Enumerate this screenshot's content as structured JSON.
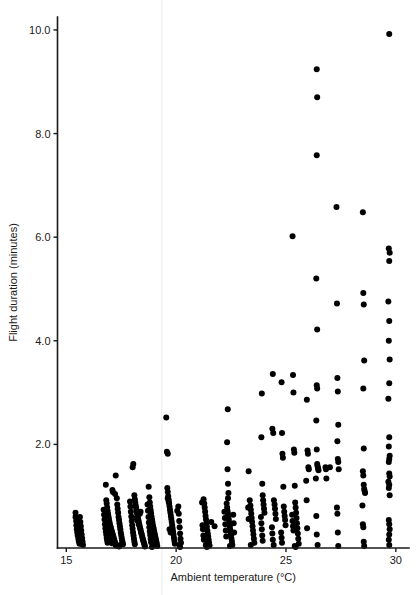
{
  "figure": {
    "background_color": "#ffffff",
    "point_color": "#000000",
    "axis_color": "#1a1a1a",
    "artifact_color": "#ececec"
  },
  "chart_data": {
    "type": "scatter",
    "title": "",
    "subtitle": "",
    "xlabel": "Ambient temperature (°C)",
    "ylabel": "Flight duration (minutes)",
    "xlim": [
      14.6,
      30.6
    ],
    "ylim": [
      0.0,
      10.25
    ],
    "xticks": [
      15,
      20,
      25,
      30
    ],
    "xticklabels": [
      "15",
      "20",
      "25",
      "30"
    ],
    "yticks": [
      2.0,
      4.0,
      6.0,
      8.0,
      10.0
    ],
    "yticklabels": [
      "2.0",
      "4.0",
      "6.0",
      "8.0",
      "10.0"
    ],
    "grid": false,
    "legend": null,
    "marker": "filled-circle",
    "marker_size_px": 3.0,
    "n_points": 403,
    "points": [
      [
        15.42,
        0.68
      ],
      [
        15.42,
        0.6
      ],
      [
        15.45,
        0.52
      ],
      [
        15.46,
        0.44
      ],
      [
        15.48,
        0.36
      ],
      [
        15.5,
        0.3
      ],
      [
        15.52,
        0.24
      ],
      [
        15.55,
        0.18
      ],
      [
        15.57,
        0.13
      ],
      [
        15.6,
        0.08
      ],
      [
        15.62,
        0.6
      ],
      [
        15.64,
        0.5
      ],
      [
        15.66,
        0.42
      ],
      [
        15.68,
        0.34
      ],
      [
        15.7,
        0.26
      ],
      [
        15.72,
        0.19
      ],
      [
        15.74,
        0.12
      ],
      [
        15.76,
        0.06
      ],
      [
        16.8,
        1.22
      ],
      [
        16.82,
        0.92
      ],
      [
        16.84,
        0.86
      ],
      [
        16.86,
        0.78
      ],
      [
        16.88,
        0.72
      ],
      [
        16.9,
        0.66
      ],
      [
        16.92,
        0.61
      ],
      [
        16.94,
        0.56
      ],
      [
        16.96,
        0.51
      ],
      [
        16.98,
        0.47
      ],
      [
        17.0,
        0.43
      ],
      [
        17.02,
        0.4
      ],
      [
        17.04,
        0.37
      ],
      [
        17.06,
        0.34
      ],
      [
        17.08,
        0.31
      ],
      [
        17.1,
        0.28
      ],
      [
        17.12,
        0.25
      ],
      [
        17.14,
        0.22
      ],
      [
        17.16,
        0.19
      ],
      [
        17.18,
        0.16
      ],
      [
        17.2,
        0.13
      ],
      [
        17.22,
        0.1
      ],
      [
        17.24,
        0.07
      ],
      [
        17.26,
        0.05
      ],
      [
        16.7,
        0.74
      ],
      [
        16.72,
        0.64
      ],
      [
        16.74,
        0.55
      ],
      [
        16.76,
        0.46
      ],
      [
        16.78,
        0.38
      ],
      [
        16.8,
        0.32
      ],
      [
        16.82,
        0.26
      ],
      [
        16.84,
        0.2
      ],
      [
        16.86,
        0.15
      ],
      [
        16.88,
        0.1
      ],
      [
        17.3,
        0.96
      ],
      [
        17.32,
        0.84
      ],
      [
        17.34,
        0.76
      ],
      [
        17.36,
        0.68
      ],
      [
        17.38,
        0.6
      ],
      [
        17.4,
        0.54
      ],
      [
        17.42,
        0.48
      ],
      [
        17.44,
        0.42
      ],
      [
        17.46,
        0.36
      ],
      [
        17.48,
        0.3
      ],
      [
        17.5,
        0.25
      ],
      [
        17.52,
        0.2
      ],
      [
        17.54,
        0.15
      ],
      [
        17.56,
        0.11
      ],
      [
        17.58,
        0.07
      ],
      [
        17.25,
        1.4
      ],
      [
        17.1,
        1.12
      ],
      [
        17.12,
        1.08
      ],
      [
        17.22,
        1.04
      ],
      [
        18.05,
        1.62
      ],
      [
        18.02,
        1.56
      ],
      [
        18.1,
        1.02
      ],
      [
        18.12,
        0.94
      ],
      [
        18.14,
        0.88
      ],
      [
        18.16,
        0.82
      ],
      [
        18.18,
        0.77
      ],
      [
        18.2,
        0.72
      ],
      [
        18.22,
        0.67
      ],
      [
        18.24,
        0.62
      ],
      [
        18.26,
        0.58
      ],
      [
        18.28,
        0.54
      ],
      [
        18.3,
        0.5
      ],
      [
        18.32,
        0.46
      ],
      [
        18.34,
        0.42
      ],
      [
        18.36,
        0.38
      ],
      [
        18.38,
        0.35
      ],
      [
        18.4,
        0.31
      ],
      [
        18.42,
        0.28
      ],
      [
        18.44,
        0.25
      ],
      [
        18.46,
        0.21
      ],
      [
        18.48,
        0.18
      ],
      [
        18.5,
        0.15
      ],
      [
        18.52,
        0.12
      ],
      [
        18.54,
        0.09
      ],
      [
        18.56,
        0.06
      ],
      [
        18.58,
        0.03
      ],
      [
        17.9,
        0.9
      ],
      [
        17.92,
        0.8
      ],
      [
        17.94,
        0.7
      ],
      [
        17.96,
        0.61
      ],
      [
        17.98,
        0.52
      ],
      [
        18.0,
        0.44
      ],
      [
        18.02,
        0.37
      ],
      [
        18.04,
        0.3
      ],
      [
        18.06,
        0.24
      ],
      [
        18.08,
        0.18
      ],
      [
        18.1,
        0.12
      ],
      [
        18.12,
        0.07
      ],
      [
        18.75,
        1.18
      ],
      [
        18.78,
        0.98
      ],
      [
        18.8,
        0.88
      ],
      [
        18.82,
        0.8
      ],
      [
        18.84,
        0.73
      ],
      [
        18.86,
        0.67
      ],
      [
        18.88,
        0.61
      ],
      [
        18.9,
        0.55
      ],
      [
        18.92,
        0.5
      ],
      [
        18.94,
        0.45
      ],
      [
        18.96,
        0.4
      ],
      [
        18.98,
        0.36
      ],
      [
        19.0,
        0.32
      ],
      [
        19.02,
        0.28
      ],
      [
        19.04,
        0.24
      ],
      [
        19.06,
        0.2
      ],
      [
        19.08,
        0.16
      ],
      [
        19.1,
        0.12
      ],
      [
        19.12,
        0.08
      ],
      [
        19.14,
        0.04
      ],
      [
        18.7,
        0.84
      ],
      [
        18.72,
        0.72
      ],
      [
        18.74,
        0.6
      ],
      [
        18.76,
        0.49
      ],
      [
        18.78,
        0.4
      ],
      [
        18.8,
        0.32
      ],
      [
        18.82,
        0.25
      ],
      [
        18.84,
        0.18
      ],
      [
        18.86,
        0.11
      ],
      [
        19.55,
        2.52
      ],
      [
        19.58,
        1.86
      ],
      [
        19.62,
        1.82
      ],
      [
        19.6,
        1.16
      ],
      [
        19.62,
        1.08
      ],
      [
        19.64,
        1.0
      ],
      [
        19.66,
        0.93
      ],
      [
        19.68,
        0.86
      ],
      [
        19.7,
        0.8
      ],
      [
        19.72,
        0.74
      ],
      [
        19.74,
        0.68
      ],
      [
        19.76,
        0.62
      ],
      [
        19.78,
        0.56
      ],
      [
        19.8,
        0.5
      ],
      [
        19.82,
        0.44
      ],
      [
        19.84,
        0.38
      ],
      [
        19.86,
        0.32
      ],
      [
        19.88,
        0.26
      ],
      [
        19.9,
        0.2
      ],
      [
        19.92,
        0.14
      ],
      [
        19.94,
        0.08
      ],
      [
        20.1,
        0.8
      ],
      [
        20.12,
        0.66
      ],
      [
        20.14,
        0.52
      ],
      [
        20.16,
        0.4
      ],
      [
        20.18,
        0.28
      ],
      [
        20.2,
        0.18
      ],
      [
        20.22,
        0.1
      ],
      [
        20.05,
        0.72
      ],
      [
        21.25,
        0.94
      ],
      [
        21.28,
        0.86
      ],
      [
        21.3,
        0.78
      ],
      [
        21.32,
        0.7
      ],
      [
        21.34,
        0.62
      ],
      [
        21.36,
        0.55
      ],
      [
        21.38,
        0.48
      ],
      [
        21.4,
        0.41
      ],
      [
        21.42,
        0.34
      ],
      [
        21.44,
        0.28
      ],
      [
        21.46,
        0.22
      ],
      [
        21.48,
        0.16
      ],
      [
        21.5,
        0.1
      ],
      [
        21.52,
        0.05
      ],
      [
        21.18,
        0.88
      ],
      [
        21.2,
        0.44
      ],
      [
        21.22,
        0.36
      ],
      [
        21.24,
        0.24
      ],
      [
        21.26,
        0.16
      ],
      [
        21.6,
        0.5
      ],
      [
        21.75,
        0.42
      ],
      [
        22.35,
        2.68
      ],
      [
        22.32,
        2.04
      ],
      [
        22.34,
        1.52
      ],
      [
        22.36,
        1.24
      ],
      [
        22.38,
        1.06
      ],
      [
        22.36,
        0.96
      ],
      [
        22.3,
        0.86
      ],
      [
        22.32,
        0.78
      ],
      [
        22.34,
        0.72
      ],
      [
        22.36,
        0.66
      ],
      [
        22.38,
        0.6
      ],
      [
        22.4,
        0.54
      ],
      [
        22.42,
        0.48
      ],
      [
        22.44,
        0.42
      ],
      [
        22.46,
        0.36
      ],
      [
        22.48,
        0.3
      ],
      [
        22.5,
        0.24
      ],
      [
        22.52,
        0.18
      ],
      [
        22.54,
        0.12
      ],
      [
        22.56,
        0.06
      ],
      [
        22.2,
        0.7
      ],
      [
        22.22,
        0.58
      ],
      [
        22.24,
        0.46
      ],
      [
        22.26,
        0.34
      ],
      [
        22.28,
        0.22
      ],
      [
        22.6,
        0.64
      ],
      [
        22.62,
        0.48
      ],
      [
        22.64,
        0.3
      ],
      [
        23.3,
        1.48
      ],
      [
        23.35,
        0.92
      ],
      [
        23.38,
        0.82
      ],
      [
        23.4,
        0.74
      ],
      [
        23.42,
        0.66
      ],
      [
        23.44,
        0.58
      ],
      [
        23.46,
        0.5
      ],
      [
        23.48,
        0.42
      ],
      [
        23.5,
        0.34
      ],
      [
        23.52,
        0.26
      ],
      [
        23.54,
        0.18
      ],
      [
        23.56,
        0.1
      ],
      [
        23.28,
        0.78
      ],
      [
        23.3,
        0.56
      ],
      [
        23.9,
        2.98
      ],
      [
        23.88,
        2.14
      ],
      [
        23.92,
        1.24
      ],
      [
        23.94,
        1.02
      ],
      [
        23.96,
        0.92
      ],
      [
        23.98,
        0.84
      ],
      [
        24.0,
        0.76
      ],
      [
        24.02,
        0.68
      ],
      [
        23.86,
        0.6
      ],
      [
        23.88,
        0.48
      ],
      [
        23.9,
        0.36
      ],
      [
        23.92,
        0.24
      ],
      [
        23.94,
        0.14
      ],
      [
        24.4,
        3.36
      ],
      [
        24.38,
        2.3
      ],
      [
        24.42,
        2.22
      ],
      [
        24.45,
        0.92
      ],
      [
        24.48,
        0.84
      ],
      [
        24.5,
        0.76
      ],
      [
        24.52,
        0.66
      ],
      [
        24.54,
        0.56
      ],
      [
        24.36,
        0.4
      ],
      [
        24.38,
        0.28
      ],
      [
        24.4,
        0.16
      ],
      [
        24.8,
        3.2
      ],
      [
        24.82,
        2.22
      ],
      [
        24.84,
        1.82
      ],
      [
        24.86,
        1.74
      ],
      [
        24.88,
        1.18
      ],
      [
        24.9,
        0.8
      ],
      [
        24.92,
        0.7
      ],
      [
        24.94,
        0.62
      ],
      [
        24.96,
        0.54
      ],
      [
        24.98,
        0.44
      ],
      [
        24.78,
        0.3
      ],
      [
        24.8,
        0.2
      ],
      [
        24.82,
        0.1
      ],
      [
        25.3,
        6.02
      ],
      [
        25.32,
        3.34
      ],
      [
        25.34,
        3.0
      ],
      [
        25.36,
        1.9
      ],
      [
        25.38,
        1.84
      ],
      [
        25.4,
        1.2
      ],
      [
        25.42,
        0.88
      ],
      [
        25.44,
        0.78
      ],
      [
        25.46,
        0.68
      ],
      [
        25.48,
        0.58
      ],
      [
        25.5,
        0.48
      ],
      [
        25.52,
        0.38
      ],
      [
        25.54,
        0.28
      ],
      [
        25.56,
        0.18
      ],
      [
        25.58,
        0.08
      ],
      [
        25.28,
        0.64
      ],
      [
        25.3,
        0.52
      ],
      [
        25.32,
        0.42
      ],
      [
        25.34,
        0.34
      ],
      [
        25.95,
        2.86
      ],
      [
        25.98,
        1.88
      ],
      [
        26.0,
        1.82
      ],
      [
        26.02,
        1.56
      ],
      [
        26.04,
        1.52
      ],
      [
        25.92,
        1.3
      ],
      [
        25.94,
        0.92
      ],
      [
        25.96,
        0.38
      ],
      [
        26.4,
        9.24
      ],
      [
        26.42,
        8.7
      ],
      [
        26.4,
        7.58
      ],
      [
        26.38,
        5.2
      ],
      [
        26.42,
        4.22
      ],
      [
        26.4,
        3.14
      ],
      [
        26.42,
        3.08
      ],
      [
        26.38,
        2.46
      ],
      [
        26.4,
        1.9
      ],
      [
        26.42,
        1.62
      ],
      [
        26.44,
        1.58
      ],
      [
        26.46,
        1.54
      ],
      [
        26.48,
        1.5
      ],
      [
        26.36,
        1.34
      ],
      [
        26.38,
        0.62
      ],
      [
        26.4,
        0.26
      ],
      [
        26.8,
        1.56
      ],
      [
        26.82,
        1.52
      ],
      [
        26.84,
        1.34
      ],
      [
        27.0,
        1.56
      ],
      [
        27.3,
        6.58
      ],
      [
        27.32,
        4.72
      ],
      [
        27.34,
        3.28
      ],
      [
        27.36,
        3.02
      ],
      [
        27.38,
        2.38
      ],
      [
        27.34,
        2.06
      ],
      [
        27.36,
        1.72
      ],
      [
        27.38,
        1.66
      ],
      [
        27.4,
        1.52
      ],
      [
        27.32,
        0.78
      ],
      [
        27.34,
        0.66
      ],
      [
        27.36,
        0.3
      ],
      [
        28.5,
        6.48
      ],
      [
        28.52,
        4.92
      ],
      [
        28.54,
        4.7
      ],
      [
        28.56,
        3.62
      ],
      [
        28.52,
        3.08
      ],
      [
        28.54,
        1.92
      ],
      [
        28.5,
        1.48
      ],
      [
        28.52,
        1.4
      ],
      [
        28.54,
        1.22
      ],
      [
        28.56,
        1.14
      ],
      [
        28.58,
        1.1
      ],
      [
        28.6,
        1.06
      ],
      [
        28.48,
        0.82
      ],
      [
        28.5,
        0.46
      ],
      [
        28.52,
        0.4
      ],
      [
        28.54,
        0.12
      ],
      [
        29.7,
        9.92
      ],
      [
        29.68,
        5.78
      ],
      [
        29.72,
        5.7
      ],
      [
        29.7,
        5.54
      ],
      [
        29.66,
        4.76
      ],
      [
        29.7,
        4.38
      ],
      [
        29.68,
        4.0
      ],
      [
        29.72,
        3.64
      ],
      [
        29.7,
        3.18
      ],
      [
        29.66,
        2.88
      ],
      [
        29.7,
        2.14
      ],
      [
        29.68,
        1.96
      ],
      [
        29.72,
        1.78
      ],
      [
        29.7,
        1.72
      ],
      [
        29.68,
        1.66
      ],
      [
        29.7,
        1.44
      ],
      [
        29.72,
        1.38
      ],
      [
        29.66,
        1.28
      ],
      [
        29.7,
        1.22
      ],
      [
        29.68,
        1.16
      ],
      [
        29.72,
        1.02
      ],
      [
        29.68,
        0.54
      ],
      [
        29.7,
        0.46
      ],
      [
        29.72,
        0.36
      ],
      [
        29.7,
        0.26
      ],
      [
        29.68,
        0.16
      ],
      [
        29.7,
        0.06
      ],
      [
        16.95,
        0.26
      ],
      [
        17.0,
        0.2
      ],
      [
        17.05,
        0.14
      ],
      [
        17.08,
        0.09
      ],
      [
        18.2,
        0.58
      ],
      [
        18.25,
        0.52
      ],
      [
        18.3,
        0.46
      ],
      [
        19.7,
        0.36
      ],
      [
        19.75,
        0.3
      ],
      [
        20.15,
        0.06
      ],
      [
        20.18,
        0.02
      ],
      [
        21.35,
        0.06
      ],
      [
        21.4,
        0.02
      ],
      [
        22.45,
        0.04
      ],
      [
        18.9,
        0.02
      ],
      [
        18.95,
        0.05
      ],
      [
        17.4,
        0.03
      ],
      [
        17.45,
        0.06
      ],
      [
        16.92,
        0.38
      ],
      [
        16.96,
        0.33
      ],
      [
        18.35,
        0.66
      ],
      [
        18.38,
        0.7
      ],
      [
        19.62,
        0.96
      ],
      [
        19.66,
        0.9
      ],
      [
        25.4,
        0.04
      ],
      [
        25.44,
        0.02
      ],
      [
        23.4,
        0.06
      ],
      [
        24.44,
        0.06
      ],
      [
        26.44,
        0.06
      ],
      [
        27.38,
        0.04
      ],
      [
        28.56,
        0.04
      ]
    ]
  },
  "artifact": {
    "name": "scan-line",
    "x_data": 19.35
  }
}
